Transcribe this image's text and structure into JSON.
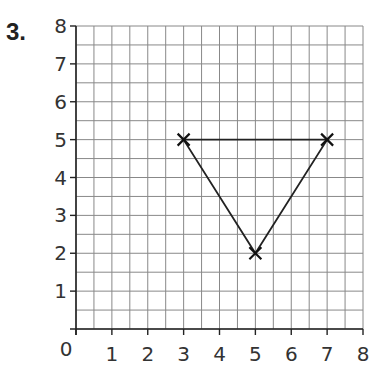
{
  "question": {
    "number": "3."
  },
  "chart_data": {
    "type": "scatter",
    "title": "",
    "xlabel": "",
    "ylabel": "",
    "xlim": [
      0,
      8
    ],
    "ylim": [
      0,
      8
    ],
    "grid": true,
    "grid_step": 0.5,
    "x_ticks": [
      "0",
      "1",
      "2",
      "3",
      "4",
      "5",
      "6",
      "7",
      "8"
    ],
    "y_ticks": [
      "1",
      "2",
      "3",
      "4",
      "5",
      "6",
      "7",
      "8"
    ],
    "series": [
      {
        "name": "triangle",
        "marker": "x",
        "closed": true,
        "points": [
          [
            3,
            5
          ],
          [
            7,
            5
          ],
          [
            5,
            2
          ]
        ]
      }
    ]
  }
}
